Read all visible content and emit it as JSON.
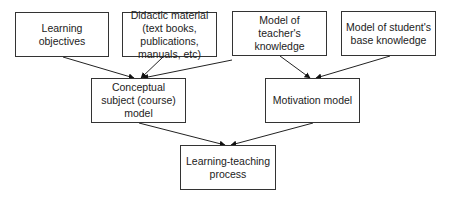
{
  "diagram": {
    "type": "flowchart",
    "nodes": [
      {
        "id": "objectives",
        "label": "Learning objectives",
        "x": 15,
        "y": 12,
        "w": 94,
        "h": 45
      },
      {
        "id": "didactic",
        "label": "Didactic material (text books, publications, manuals, etc)",
        "x": 122,
        "y": 12,
        "w": 95,
        "h": 45
      },
      {
        "id": "teacher",
        "label": "Model of teacher's knowledge",
        "x": 232,
        "y": 11,
        "w": 95,
        "h": 45
      },
      {
        "id": "student",
        "label": "Model of student's base knowledge",
        "x": 341,
        "y": 11,
        "w": 95,
        "h": 45
      },
      {
        "id": "conceptual",
        "label": "Conceptual subject (course) model",
        "x": 91,
        "y": 78,
        "w": 95,
        "h": 45
      },
      {
        "id": "motivation",
        "label": "Motivation model",
        "x": 265,
        "y": 78,
        "w": 95,
        "h": 45
      },
      {
        "id": "process",
        "label": "Learning-teaching process",
        "x": 180,
        "y": 145,
        "w": 96,
        "h": 45
      }
    ],
    "edges": [
      {
        "from": "objectives",
        "to": "conceptual",
        "x1": 63,
        "y1": 57,
        "x2": 134,
        "y2": 78
      },
      {
        "from": "didactic",
        "to": "conceptual",
        "x1": 163,
        "y1": 57,
        "x2": 141,
        "y2": 78
      },
      {
        "from": "teacher",
        "to": "conceptual",
        "x1": 232,
        "y1": 60,
        "x2": 143,
        "y2": 78
      },
      {
        "from": "teacher",
        "to": "motivation",
        "x1": 280,
        "y1": 56,
        "x2": 310,
        "y2": 78
      },
      {
        "from": "student",
        "to": "motivation",
        "x1": 390,
        "y1": 56,
        "x2": 316,
        "y2": 78
      },
      {
        "from": "conceptual",
        "to": "process",
        "x1": 139,
        "y1": 123,
        "x2": 225,
        "y2": 145
      },
      {
        "from": "motivation",
        "to": "process",
        "x1": 313,
        "y1": 123,
        "x2": 231,
        "y2": 145
      }
    ]
  }
}
